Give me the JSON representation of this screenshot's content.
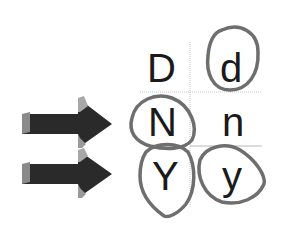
{
  "diagram": {
    "grid": {
      "rows": [
        {
          "left": "D",
          "right": "d"
        },
        {
          "left": "N",
          "right": "n"
        },
        {
          "left": "Y",
          "right": "y"
        }
      ],
      "circled": [
        "d",
        "N",
        "Y",
        "y"
      ]
    },
    "arrows": [
      {
        "points_to_row": "N",
        "direction": "right"
      },
      {
        "points_to_row": "Y",
        "direction": "right"
      }
    ],
    "colors": {
      "text": "#1a1a1a",
      "arrow_dark": "#2a2a2a",
      "arrow_light": "#9a9a9a",
      "circle_stroke": "#6e6e6e",
      "gridline": "#c8c8c8"
    }
  }
}
